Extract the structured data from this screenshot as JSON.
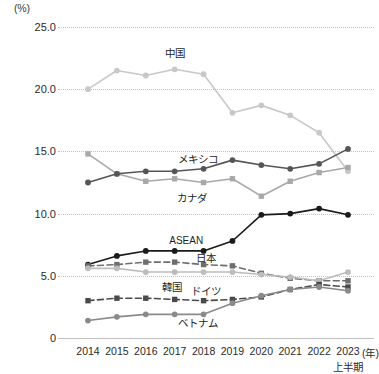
{
  "chart_data": {
    "type": "line",
    "title": "",
    "xlabel": "(年)",
    "ylabel": "(%)",
    "y_unit": "(%)",
    "x_unit": "(年)",
    "x_sub_note": "上半期",
    "grid": true,
    "legend_position": "inline-labels",
    "ylim": [
      0,
      25
    ],
    "yticks": [
      "0",
      "5.0",
      "10.0",
      "15.0",
      "20.0",
      "25.0"
    ],
    "ytick_values": [
      0,
      5,
      10,
      15,
      20,
      25
    ],
    "categories": [
      "2014",
      "2015",
      "2016",
      "2017",
      "2018",
      "2019",
      "2020",
      "2021",
      "2022",
      "2023"
    ],
    "series": [
      {
        "name": "中国",
        "label": "中国",
        "color": "#c8c8c8",
        "style": "solid",
        "marker": "circle",
        "values": [
          20.0,
          21.5,
          21.1,
          21.6,
          21.2,
          18.1,
          18.7,
          17.9,
          16.5,
          13.4
        ]
      },
      {
        "name": "カナダ",
        "label": "カナダ",
        "color": "#a8a8a8",
        "style": "solid",
        "marker": "square",
        "values": [
          14.8,
          13.2,
          12.6,
          12.8,
          12.5,
          12.8,
          11.4,
          12.6,
          13.3,
          13.7
        ]
      },
      {
        "name": "メキシコ",
        "label": "メキシコ",
        "color": "#555555",
        "style": "solid",
        "marker": "circle",
        "values": [
          12.5,
          13.2,
          13.4,
          13.4,
          13.6,
          14.3,
          13.9,
          13.6,
          14.0,
          15.2
        ]
      },
      {
        "name": "ASEAN",
        "label": "ASEAN",
        "color": "#1a1a1a",
        "style": "solid",
        "marker": "circle",
        "values": [
          5.9,
          6.6,
          7.0,
          7.0,
          7.0,
          7.8,
          9.9,
          10.0,
          10.4,
          9.9
        ]
      },
      {
        "name": "日本",
        "label": "日本",
        "color": "#6e6e6e",
        "style": "dashed",
        "marker": "square",
        "values": [
          5.8,
          5.9,
          6.1,
          6.1,
          5.9,
          5.8,
          5.2,
          4.8,
          4.6,
          4.6
        ]
      },
      {
        "name": "ドイツ",
        "label": "ドイツ",
        "color": "#bcbcbc",
        "style": "solid",
        "marker": "circle",
        "values": [
          5.6,
          5.6,
          5.3,
          5.3,
          5.3,
          5.3,
          5.1,
          4.9,
          4.6,
          5.3
        ]
      },
      {
        "name": "韓国",
        "label": "韓国",
        "color": "#4a4a4a",
        "style": "dashed",
        "marker": "square",
        "values": [
          3.0,
          3.2,
          3.2,
          3.1,
          3.0,
          3.1,
          3.3,
          3.9,
          4.3,
          4.1
        ]
      },
      {
        "name": "ベトナム",
        "label": "ベトナム",
        "color": "#8a8a8a",
        "style": "solid",
        "marker": "circle",
        "values": [
          1.4,
          1.7,
          1.9,
          1.9,
          1.9,
          2.8,
          3.4,
          3.9,
          4.1,
          3.8
        ]
      }
    ],
    "annotations": [
      {
        "text": "中国",
        "x": "2017",
        "y": 23.0
      },
      {
        "text": "メキシコ",
        "x": "2017.8",
        "y": 14.5
      },
      {
        "text": "カナダ",
        "x": "2017.6",
        "y": 11.3
      },
      {
        "text": "ASEAN",
        "x": "2017.4",
        "y": 7.9
      },
      {
        "text": "日本",
        "x": "2018.1",
        "y": 6.5
      },
      {
        "text": "ドイツ",
        "x": "2018.1",
        "y": 3.9
      },
      {
        "text": "韓国",
        "x": "2016.9",
        "y": 4.2
      },
      {
        "text": "ベトナム",
        "x": "2017.8",
        "y": 1.3
      }
    ]
  }
}
